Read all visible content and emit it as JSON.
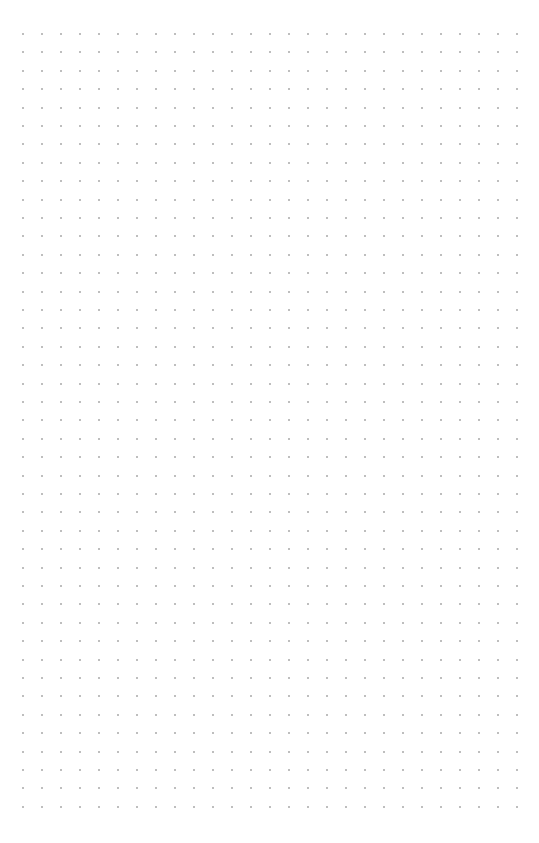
{
  "page": {
    "type": "dot-grid",
    "background": "#ffffff"
  },
  "grid": {
    "columns": 27,
    "rows": 43,
    "origin_x": 23,
    "origin_y": 34,
    "spacing_x": 19,
    "spacing_y": 18.4,
    "dot_size": 2,
    "dot_color": "#a8a8a8"
  }
}
